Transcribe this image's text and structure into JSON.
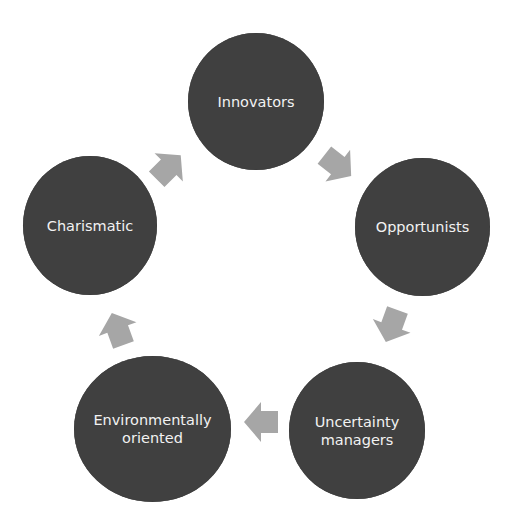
{
  "diagram": {
    "type": "cycle",
    "node_color": "#404040",
    "text_color": "#f2f2f2",
    "arrow_color": "#a6a6a6",
    "nodes": [
      {
        "id": "innovators",
        "line1": "Innovators",
        "line2": ""
      },
      {
        "id": "opportunists",
        "line1": "Opportunists",
        "line2": ""
      },
      {
        "id": "uncertainty-managers",
        "line1": "Uncertainty",
        "line2": "managers"
      },
      {
        "id": "environmentally-oriented",
        "line1": "Environmentally",
        "line2": "oriented"
      },
      {
        "id": "charismatic",
        "line1": "Charismatic",
        "line2": ""
      }
    ],
    "edges": [
      {
        "from": "charismatic",
        "to": "innovators"
      },
      {
        "from": "innovators",
        "to": "opportunists"
      },
      {
        "from": "opportunists",
        "to": "uncertainty-managers"
      },
      {
        "from": "uncertainty-managers",
        "to": "environmentally-oriented"
      },
      {
        "from": "environmentally-oriented",
        "to": "charismatic"
      }
    ]
  }
}
